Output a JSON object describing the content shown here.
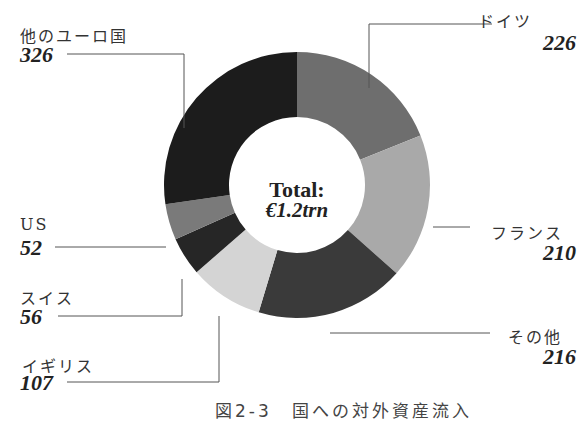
{
  "chart_data": {
    "type": "pie",
    "subtype": "donut",
    "title": "",
    "center_label": {
      "line1": "Total:",
      "line2": "€1.2trn"
    },
    "categories": [
      "ドイツ",
      "フランス",
      "その他",
      "イギリス",
      "スイス",
      "US",
      "他のユーロ国"
    ],
    "values": [
      226,
      210,
      216,
      107,
      56,
      52,
      326
    ],
    "colors": [
      "#6e6e6e",
      "#a9a9a9",
      "#3a3a3a",
      "#d4d4d4",
      "#262626",
      "#7a7a7a",
      "#1c1c1c"
    ],
    "start_angle_deg": 0,
    "direction": "clockwise",
    "legend": "callout labels",
    "caption": "図2-3 国への対外資産流入"
  },
  "labels": {
    "germany": {
      "name": "ドイツ",
      "value": "226"
    },
    "france": {
      "name": "フランス",
      "value": "210"
    },
    "other": {
      "name": "その他",
      "value": "216"
    },
    "uk": {
      "name": "イギリス",
      "value": "107"
    },
    "swiss": {
      "name": "スイス",
      "value": "56"
    },
    "us": {
      "name": "US",
      "value": "52"
    },
    "euro": {
      "name": "他のユーロ国",
      "value": "326"
    }
  },
  "center": {
    "line1": "Total:",
    "line2": "€1.2trn"
  },
  "caption": "図2-3　国への対外資産流入"
}
